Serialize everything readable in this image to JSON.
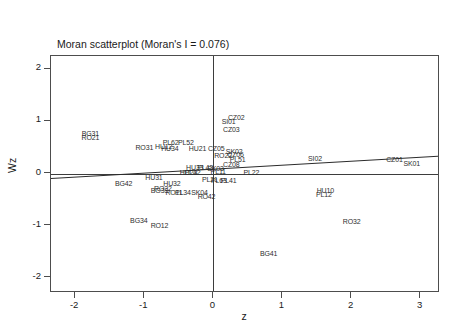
{
  "chart_data": {
    "type": "scatter",
    "title": "Moran scatterplot (Moran's I = 0.076)",
    "subtitle": "IRGDPPC11",
    "xlabel": "z",
    "ylabel": "Wz",
    "xlim": [
      -2.35,
      3.25
    ],
    "ylim": [
      -2.25,
      2.25
    ],
    "xticks": [
      "-2",
      "-1",
      "0",
      "1",
      "2",
      "3"
    ],
    "xtick_values": [
      -2,
      -1,
      0,
      1,
      2,
      3
    ],
    "yticks": [
      "2",
      "1",
      "0",
      "-1",
      "-2"
    ],
    "ytick_values": [
      2,
      1,
      0,
      -1,
      -2
    ],
    "grid": false,
    "legend": false,
    "morans_i": 0.076,
    "reference_lines": {
      "vertical_x": 0,
      "horizontal_y": 0
    },
    "fit_line": {
      "slope": 0.076,
      "intercept": 0.09,
      "x_start": -2.35,
      "x_end": 3.25
    },
    "point_label_field": "region code",
    "points": [
      {
        "label": "BG31",
        "x": -1.78,
        "y": 0.78
      },
      {
        "label": "RO21",
        "x": -1.78,
        "y": 0.7
      },
      {
        "label": "RO31",
        "x": -1.0,
        "y": 0.5
      },
      {
        "label": "HU12",
        "x": -0.72,
        "y": 0.52
      },
      {
        "label": "HU34",
        "x": -0.63,
        "y": 0.49
      },
      {
        "label": "PL62",
        "x": -0.62,
        "y": 0.6
      },
      {
        "label": "PL52",
        "x": -0.4,
        "y": 0.6
      },
      {
        "label": "HU21",
        "x": -0.23,
        "y": 0.48
      },
      {
        "label": "CZ02",
        "x": 0.33,
        "y": 1.09
      },
      {
        "label": "SI01",
        "x": 0.22,
        "y": 1.0
      },
      {
        "label": "CZ03",
        "x": 0.26,
        "y": 0.86
      },
      {
        "label": "CZ05",
        "x": 0.04,
        "y": 0.48
      },
      {
        "label": "SK02",
        "x": 0.3,
        "y": 0.44
      },
      {
        "label": "CZ06",
        "x": 0.32,
        "y": 0.37
      },
      {
        "label": "RO22",
        "x": 0.14,
        "y": 0.36
      },
      {
        "label": "PL51",
        "x": 0.35,
        "y": 0.27
      },
      {
        "label": "CZ08",
        "x": 0.26,
        "y": 0.19
      },
      {
        "label": "SI02",
        "x": 1.47,
        "y": 0.29
      },
      {
        "label": "CZ01",
        "x": 2.62,
        "y": 0.27
      },
      {
        "label": "SK01",
        "x": 2.87,
        "y": 0.21
      },
      {
        "label": "HU33",
        "x": -0.27,
        "y": 0.13
      },
      {
        "label": "PL43",
        "x": -0.12,
        "y": 0.13
      },
      {
        "label": "SK03",
        "x": 0.03,
        "y": 0.1
      },
      {
        "label": "PL11",
        "x": 0.07,
        "y": 0.04
      },
      {
        "label": "PL22",
        "x": 0.55,
        "y": 0.03
      },
      {
        "label": "HU23",
        "x": -0.36,
        "y": 0.02
      },
      {
        "label": "PL42",
        "x": -0.3,
        "y": 0.02
      },
      {
        "label": "HU31",
        "x": -0.86,
        "y": -0.06
      },
      {
        "label": "PL21",
        "x": -0.05,
        "y": -0.11
      },
      {
        "label": "PL63",
        "x": 0.08,
        "y": -0.12
      },
      {
        "label": "PL41",
        "x": 0.22,
        "y": -0.12
      },
      {
        "label": "BG42",
        "x": -1.3,
        "y": -0.18
      },
      {
        "label": "HU32",
        "x": -0.6,
        "y": -0.19
      },
      {
        "label": "RO22b",
        "x": -0.73,
        "y": -0.27
      },
      {
        "label": "BG33",
        "x": -0.78,
        "y": -0.31
      },
      {
        "label": "RO11",
        "x": -0.57,
        "y": -0.36
      },
      {
        "label": "PL34",
        "x": -0.44,
        "y": -0.36
      },
      {
        "label": "SK04",
        "x": -0.2,
        "y": -0.35
      },
      {
        "label": "RO42",
        "x": -0.1,
        "y": -0.43
      },
      {
        "label": "HU10",
        "x": 1.62,
        "y": -0.31
      },
      {
        "label": "PL12",
        "x": 1.6,
        "y": -0.39
      },
      {
        "label": "BG34",
        "x": -1.08,
        "y": -0.89
      },
      {
        "label": "RO12",
        "x": -0.78,
        "y": -0.98
      },
      {
        "label": "RO32",
        "x": 2.0,
        "y": -0.91
      },
      {
        "label": "BG41",
        "x": 0.8,
        "y": -1.52
      }
    ]
  },
  "chart": {
    "title": "Moran scatterplot (Moran's I = 0.076)",
    "subtitle": "IRGDPPC11",
    "xlabel": "z",
    "ylabel": "Wz"
  }
}
